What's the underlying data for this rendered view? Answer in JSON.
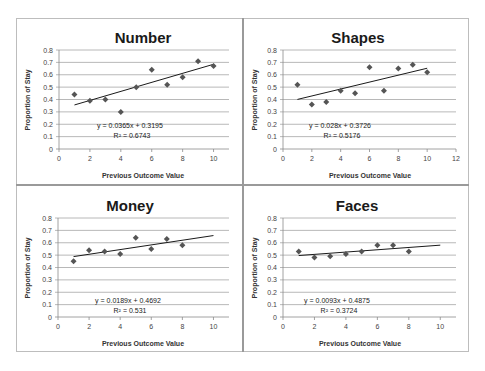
{
  "colors": {
    "grid": "#a6a6a6",
    "axis": "#8c8c8c",
    "marker": "#555555",
    "trend": "#1a1a1a",
    "divider": "#9a9a9a"
  },
  "chart_data": [
    {
      "type": "scatter",
      "title": "Number",
      "xlabel": "Previous Outcome Value",
      "ylabel": "Proportion of Stay",
      "xlim": [
        0,
        11
      ],
      "xticks": [
        0,
        2,
        4,
        6,
        8,
        10
      ],
      "ylim": [
        0,
        0.8
      ],
      "yticks": [
        0,
        0.1,
        0.2,
        0.3,
        0.4,
        0.5,
        0.6,
        0.7,
        0.8
      ],
      "grid": true,
      "x": [
        1,
        2,
        3,
        4,
        5,
        6,
        7,
        8,
        9,
        10
      ],
      "y": [
        0.44,
        0.39,
        0.4,
        0.3,
        0.5,
        0.64,
        0.52,
        0.58,
        0.71,
        0.67
      ],
      "trendline": {
        "slope": 0.0365,
        "intercept": 0.3195,
        "x_range": [
          1,
          10
        ]
      },
      "equation": "y = 0.0365x + 0.3195",
      "r_squared": "R² = 0.6743"
    },
    {
      "type": "scatter",
      "title": "Shapes",
      "xlabel": "Previous Outcome Value",
      "ylabel": "Proportion of Stay",
      "xlim": [
        0,
        12
      ],
      "xticks": [
        0,
        2,
        4,
        6,
        8,
        10,
        12
      ],
      "ylim": [
        0,
        0.8
      ],
      "yticks": [
        0,
        0.1,
        0.2,
        0.3,
        0.4,
        0.5,
        0.6,
        0.7,
        0.8
      ],
      "grid": true,
      "x": [
        1,
        2,
        3,
        4,
        5,
        6,
        7,
        8,
        9,
        10
      ],
      "y": [
        0.52,
        0.36,
        0.38,
        0.47,
        0.45,
        0.66,
        0.47,
        0.65,
        0.68,
        0.62
      ],
      "trendline": {
        "slope": 0.028,
        "intercept": 0.3726,
        "x_range": [
          1,
          10
        ]
      },
      "equation": "y = 0.028x + 0.3726",
      "r_squared": "R² = 0.5176"
    },
    {
      "type": "scatter",
      "title": "Money",
      "xlabel": "Previous Outcome Value",
      "ylabel": "Proportion of Stay",
      "xlim": [
        0,
        11
      ],
      "xticks": [
        0,
        2,
        4,
        6,
        8,
        10
      ],
      "ylim": [
        0,
        0.8
      ],
      "yticks": [
        0,
        0.1,
        0.2,
        0.3,
        0.4,
        0.5,
        0.6,
        0.7,
        0.8
      ],
      "grid": true,
      "x": [
        1,
        2,
        3,
        4,
        5,
        6,
        7,
        8
      ],
      "y": [
        0.45,
        0.54,
        0.53,
        0.51,
        0.64,
        0.55,
        0.63,
        0.58
      ],
      "trendline": {
        "slope": 0.0189,
        "intercept": 0.4692,
        "x_range": [
          1,
          10
        ]
      },
      "equation": "y = 0.0189x + 0.4692",
      "r_squared": "R² = 0.531"
    },
    {
      "type": "scatter",
      "title": "Faces",
      "xlabel": "Previous Outcome Value",
      "ylabel": "Proportion of Stay",
      "xlim": [
        0,
        11
      ],
      "xticks": [
        0,
        2,
        4,
        6,
        8,
        10
      ],
      "ylim": [
        0,
        0.8
      ],
      "yticks": [
        0,
        0.1,
        0.2,
        0.3,
        0.4,
        0.5,
        0.6,
        0.7,
        0.8
      ],
      "grid": true,
      "x": [
        1,
        2,
        3,
        4,
        5,
        6,
        7,
        8
      ],
      "y": [
        0.53,
        0.48,
        0.49,
        0.51,
        0.53,
        0.58,
        0.58,
        0.53
      ],
      "trendline": {
        "slope": 0.0093,
        "intercept": 0.4875,
        "x_range": [
          1,
          10
        ]
      },
      "equation": "y = 0.0093x + 0.4875",
      "r_squared": "R² = 0.3724"
    }
  ],
  "layout": {
    "panels": [
      {
        "plot": {
          "x0": 59,
          "x1": 229,
          "y0": 149,
          "y1": 50
        },
        "title_pos": [
          143,
          38
        ],
        "eq_pos": [
          130,
          128
        ],
        "xlabel_pos": [
          143,
          178
        ],
        "ylabel_pos": [
          30,
          100
        ]
      },
      {
        "plot": {
          "x0": 283,
          "x1": 456,
          "y0": 149,
          "y1": 50
        },
        "title_pos": [
          358,
          38
        ],
        "eq_pos": [
          340,
          128
        ],
        "xlabel_pos": [
          370,
          178
        ],
        "ylabel_pos": [
          257,
          100
        ]
      },
      {
        "plot": {
          "x0": 58,
          "x1": 229,
          "y0": 317,
          "y1": 218
        },
        "title_pos": [
          130,
          206
        ],
        "eq_pos": [
          128,
          303
        ],
        "xlabel_pos": [
          143,
          346
        ],
        "ylabel_pos": [
          30,
          268
        ]
      },
      {
        "plot": {
          "x0": 283,
          "x1": 456,
          "y0": 317,
          "y1": 218
        },
        "title_pos": [
          357,
          206
        ],
        "eq_pos": [
          337,
          303
        ],
        "xlabel_pos": [
          360,
          346
        ],
        "ylabel_pos": [
          257,
          268
        ]
      }
    ]
  }
}
